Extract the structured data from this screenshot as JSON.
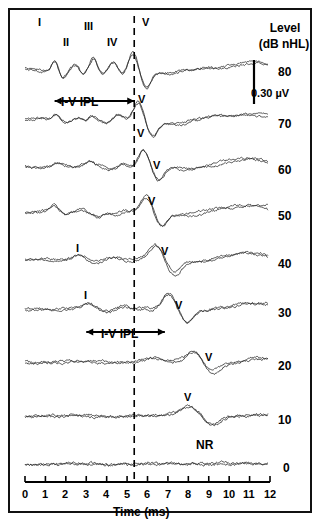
{
  "figure": {
    "title_right": "Level",
    "title_right_units": "(dB nHL)",
    "x_axis_title": "Time (ms)",
    "scalebar_label": "0.30 µV",
    "no_response_label": "NR",
    "ipl_label": "I-V IPL",
    "background": "#ffffff",
    "ink": "#000000",
    "trace_color": "#333333"
  },
  "chart_data": {
    "type": "line",
    "xlabel": "Time (ms)",
    "ylabel": "Level (dB nHL)",
    "xlim": [
      0,
      12
    ],
    "xticks": [
      0,
      1,
      2,
      3,
      4,
      5,
      6,
      7,
      8,
      9,
      10,
      11,
      12
    ],
    "xtick_labels": [
      "0",
      "1",
      "2",
      "3",
      "4",
      "5",
      "6",
      "7",
      "8",
      "9",
      "10",
      "11",
      "12"
    ],
    "grid": false,
    "legend": "none",
    "scale_bar": {
      "value": 0.3,
      "units": "µV",
      "label": "0.30 µV"
    },
    "marker_line": {
      "kind": "dashed-vertical",
      "time_ms": 5.35
    },
    "annotations": [
      {
        "text": "I",
        "time_ms": 1.45,
        "level": 80
      },
      {
        "text": "II",
        "time_ms": 2.45,
        "level": 80
      },
      {
        "text": "III",
        "time_ms": 3.35,
        "level": 80
      },
      {
        "text": "IV",
        "time_ms": 4.35,
        "level": 80
      },
      {
        "text": "V",
        "time_ms": 5.6,
        "level": 80
      },
      {
        "text": "V",
        "time_ms": 5.8,
        "level": 70
      },
      {
        "text": "V",
        "time_ms": 6.5,
        "level": 60
      },
      {
        "text": "V",
        "time_ms": 6.25,
        "level": 50
      },
      {
        "text": "I",
        "time_ms": 2.65,
        "level": 40
      },
      {
        "text": "V",
        "time_ms": 6.85,
        "level": 40
      },
      {
        "text": "I",
        "time_ms": 3.05,
        "level": 30
      },
      {
        "text": "V",
        "time_ms": 7.55,
        "level": 30
      },
      {
        "text": "V",
        "time_ms": 9.0,
        "level": 20
      },
      {
        "text": "V",
        "time_ms": 8.0,
        "level": 10
      },
      {
        "text": "NR",
        "time_ms": 8.3,
        "level": 0
      }
    ],
    "ipl_arrows": [
      {
        "label": "I-V IPL",
        "start_ms": 1.45,
        "end_ms": 5.35,
        "level": 80
      },
      {
        "label": "I-V IPL",
        "start_ms": 3.0,
        "end_ms": 6.85,
        "level": 30
      }
    ],
    "series": [
      {
        "name": "80",
        "level_db": 80,
        "replicates": 2,
        "label": "80"
      },
      {
        "name": "70",
        "level_db": 70,
        "replicates": 2,
        "label": "70"
      },
      {
        "name": "60",
        "level_db": 60,
        "replicates": 2,
        "label": "60"
      },
      {
        "name": "50",
        "level_db": 50,
        "replicates": 2,
        "label": "50"
      },
      {
        "name": "40",
        "level_db": 40,
        "replicates": 2,
        "label": "40"
      },
      {
        "name": "30",
        "level_db": 30,
        "replicates": 2,
        "label": "30"
      },
      {
        "name": "20",
        "level_db": 20,
        "replicates": 2,
        "label": "20"
      },
      {
        "name": "10",
        "level_db": 10,
        "replicates": 2,
        "label": "10"
      },
      {
        "name": "0",
        "level_db": 0,
        "replicates": 2,
        "label": "0"
      }
    ],
    "wave_v_latency_ms": {
      "80": 5.3,
      "70": 5.55,
      "60": 5.8,
      "50": 5.95,
      "40": 6.4,
      "30": 7.05,
      "20": 8.3,
      "10": 8.1,
      "0": null
    },
    "wave_i_latency_ms": {
      "80": 1.45,
      "40": 2.65,
      "30": 3.05
    }
  },
  "peak_labels": {
    "I": "I",
    "II": "II",
    "III": "III",
    "IV": "IV",
    "V": "V"
  },
  "levels": [
    "80",
    "70",
    "60",
    "50",
    "40",
    "30",
    "20",
    "10",
    "0"
  ],
  "xticks": [
    "0",
    "1",
    "2",
    "3",
    "4",
    "5",
    "6",
    "7",
    "8",
    "9",
    "10",
    "11",
    "12"
  ]
}
